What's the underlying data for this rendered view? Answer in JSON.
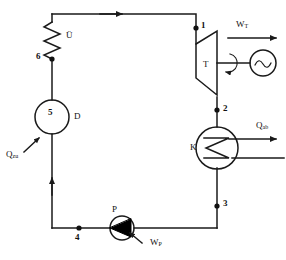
{
  "diagram": {
    "stroke_color": "#1a1a1a",
    "fill_color": "#000000",
    "background": "#ffffff"
  },
  "components": {
    "superheater": {
      "label": "Ü",
      "name": "superheater-coil"
    },
    "steam_generator": {
      "label": "D",
      "name": "steam-generator-drum"
    },
    "turbine": {
      "label": "T",
      "name": "turbine"
    },
    "generator": {
      "label": "",
      "name": "electric-generator"
    },
    "condenser": {
      "label": "K",
      "name": "condenser"
    },
    "pump": {
      "label": "P",
      "name": "pump"
    }
  },
  "state_points": [
    {
      "id": "1",
      "label": "1"
    },
    {
      "id": "2",
      "label": "2"
    },
    {
      "id": "3",
      "label": "3"
    },
    {
      "id": "4",
      "label": "4"
    },
    {
      "id": "5",
      "label": "5"
    },
    {
      "id": "6",
      "label": "6"
    }
  ],
  "flows": {
    "turbine_work": {
      "symbol": "W",
      "subscript": "T"
    },
    "pump_work": {
      "symbol": "W",
      "subscript": "P"
    },
    "heat_in": {
      "symbol": "Q",
      "subscript": "zu"
    },
    "heat_out": {
      "symbol": "Q",
      "subscript": "ab"
    }
  }
}
